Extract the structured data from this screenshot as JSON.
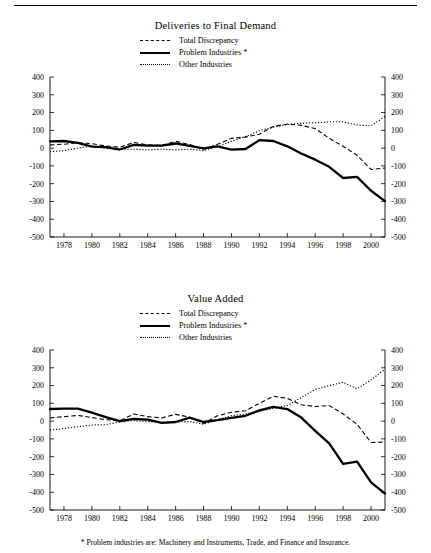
{
  "footnote": "* Problem industries are: Machinery and Instruments, Trade, and Finance and Insurance.",
  "legend": {
    "total_discrepancy": "Total Discrepancy",
    "problem_industries": "Problem Industries *",
    "other_industries": "Other Industries"
  },
  "panels": [
    {
      "id": "deliveries",
      "title": "Deliveries to Final Demand"
    },
    {
      "id": "valueadded",
      "title": "Value Added"
    }
  ],
  "chart_data": [
    {
      "type": "line",
      "title": "Deliveries to Final Demand",
      "xlabel": "",
      "ylabel": "",
      "xlim": [
        1977,
        2001
      ],
      "ylim": [
        -500,
        400
      ],
      "ytick_values": [
        400,
        300,
        200,
        100,
        0,
        -100,
        -200,
        -300,
        -400,
        -500
      ],
      "ytick_labels": [
        "400",
        "300",
        "200",
        "100",
        "0",
        "-100",
        "-200",
        "-300",
        "-400",
        "-500"
      ],
      "xtick_values": [
        1978,
        1980,
        1982,
        1984,
        1986,
        1988,
        1990,
        1992,
        1994,
        1996,
        1998,
        2000
      ],
      "xtick_labels": [
        "1978",
        "1980",
        "1982",
        "1984",
        "1986",
        "1988",
        "1990",
        "1992",
        "1994",
        "1996",
        "1998",
        "2000"
      ],
      "grid": false,
      "legend_position": "top-center",
      "dual_y_axis": true,
      "x": [
        1977,
        1978,
        1979,
        1980,
        1981,
        1982,
        1983,
        1984,
        1985,
        1986,
        1987,
        1988,
        1989,
        1990,
        1991,
        1992,
        1993,
        1994,
        1995,
        1996,
        1997,
        1998,
        1999,
        2000,
        2001
      ],
      "series": [
        {
          "name": "Total Discrepancy",
          "style": "dashed",
          "values": [
            18,
            22,
            30,
            25,
            12,
            5,
            32,
            18,
            15,
            38,
            20,
            -8,
            22,
            55,
            62,
            78,
            122,
            135,
            128,
            110,
            55,
            10,
            -40,
            -120,
            -112
          ]
        },
        {
          "name": "Problem Industries *",
          "style": "solid",
          "values": [
            38,
            40,
            30,
            8,
            5,
            -8,
            18,
            14,
            14,
            26,
            12,
            -2,
            10,
            -8,
            -5,
            45,
            40,
            10,
            -30,
            -65,
            -105,
            -168,
            -162,
            -240,
            -298
          ]
        },
        {
          "name": "Other Industries",
          "style": "dotted",
          "values": [
            -20,
            -14,
            0,
            12,
            -2,
            -6,
            -6,
            -10,
            -6,
            -10,
            -6,
            -14,
            8,
            38,
            65,
            98,
            118,
            132,
            140,
            142,
            148,
            148,
            130,
            125,
            178
          ]
        }
      ]
    },
    {
      "type": "line",
      "title": "Value Added",
      "xlabel": "",
      "ylabel": "",
      "xlim": [
        1977,
        2001
      ],
      "ylim": [
        -500,
        400
      ],
      "ytick_values": [
        400,
        300,
        200,
        100,
        0,
        -100,
        -200,
        -300,
        -400,
        -500
      ],
      "ytick_labels": [
        "400",
        "300",
        "200",
        "100",
        "0",
        "-100",
        "-200",
        "-300",
        "-400",
        "-500"
      ],
      "xtick_values": [
        1978,
        1980,
        1982,
        1984,
        1986,
        1988,
        1990,
        1992,
        1994,
        1996,
        1998,
        2000
      ],
      "xtick_labels": [
        "1978",
        "1980",
        "1982",
        "1984",
        "1986",
        "1988",
        "1990",
        "1992",
        "1994",
        "1996",
        "1998",
        "2000"
      ],
      "grid": false,
      "legend_position": "top-center",
      "dual_y_axis": true,
      "x": [
        1977,
        1978,
        1979,
        1980,
        1981,
        1982,
        1983,
        1984,
        1985,
        1986,
        1987,
        1988,
        1989,
        1990,
        1991,
        1992,
        1993,
        1994,
        1995,
        1996,
        1997,
        1998,
        1999,
        2000,
        2001
      ],
      "series": [
        {
          "name": "Total Discrepancy",
          "style": "dashed",
          "values": [
            18,
            25,
            32,
            20,
            8,
            2,
            40,
            25,
            18,
            38,
            22,
            -14,
            30,
            50,
            58,
            100,
            140,
            128,
            92,
            82,
            88,
            40,
            -18,
            -120,
            -118
          ]
        },
        {
          "name": "Problem Industries *",
          "style": "solid",
          "values": [
            68,
            70,
            70,
            48,
            22,
            0,
            12,
            8,
            -10,
            -5,
            20,
            -5,
            5,
            18,
            30,
            60,
            80,
            68,
            20,
            -55,
            -125,
            -240,
            -228,
            -345,
            -408
          ]
        },
        {
          "name": "Other Industries",
          "style": "dotted",
          "values": [
            -50,
            -42,
            -32,
            -22,
            -20,
            -5,
            2,
            -2,
            -8,
            -5,
            -2,
            -18,
            8,
            30,
            40,
            55,
            72,
            88,
            132,
            178,
            200,
            218,
            182,
            232,
            292
          ]
        }
      ]
    }
  ]
}
